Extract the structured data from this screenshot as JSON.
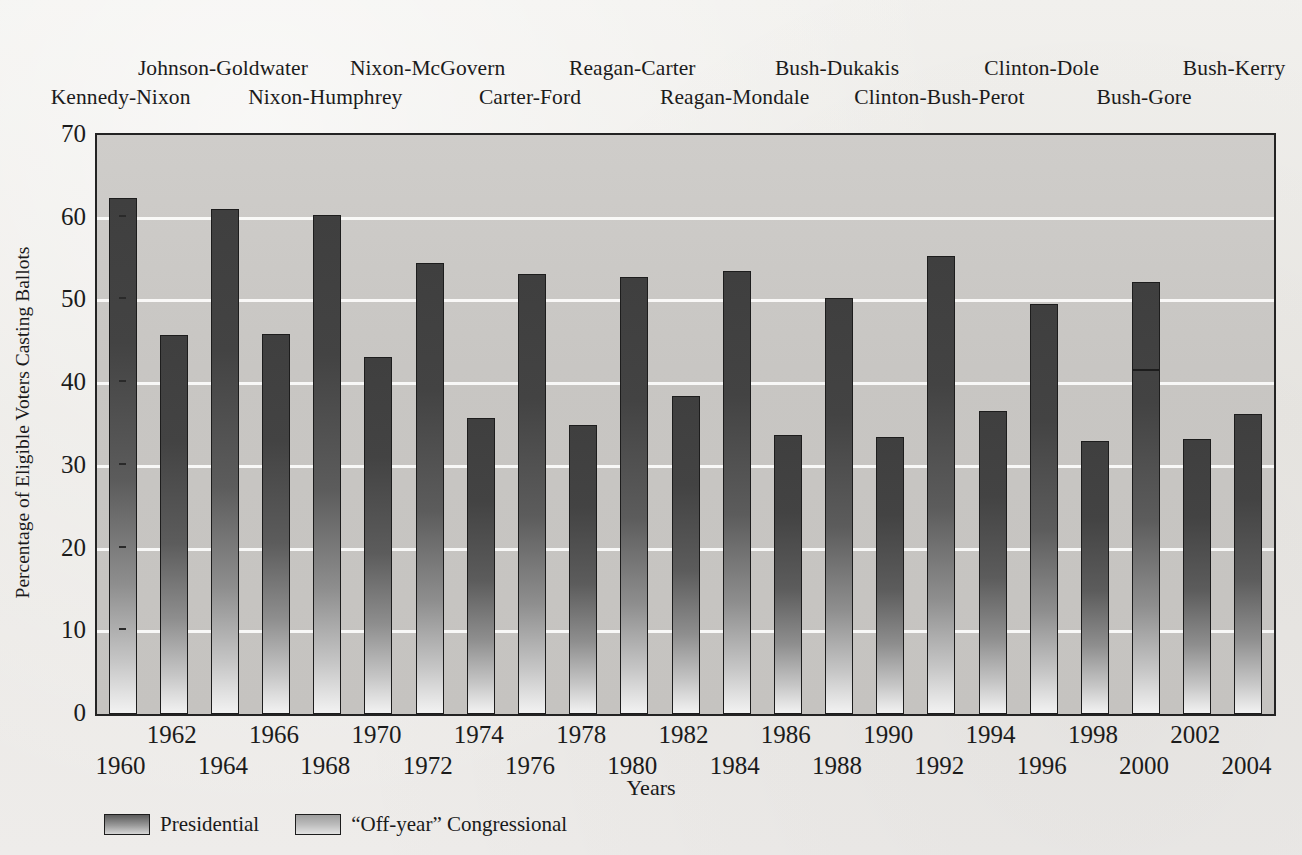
{
  "chart_data": {
    "type": "bar",
    "title": "",
    "xlabel": "Years",
    "ylabel": "Percentage of Eligible Voters Casting Ballots",
    "ylim": [
      0,
      70
    ],
    "ytick_values": [
      0,
      10,
      20,
      30,
      40,
      50,
      60,
      70
    ],
    "ytick_labels": [
      "0",
      "10",
      "20",
      "30",
      "40",
      "50",
      "60",
      "70"
    ],
    "grid": "horizontal-white-gridlines",
    "legend_position": "below-plot-left",
    "categories": [
      "1960",
      "1962",
      "1964",
      "1966",
      "1968",
      "1970",
      "1972",
      "1974",
      "1976",
      "1978",
      "1980",
      "1982",
      "1984",
      "1986",
      "1988",
      "1990",
      "1992",
      "1994",
      "1996",
      "1998",
      "2000",
      "2002",
      "2004"
    ],
    "values": [
      62.4,
      45.8,
      61.0,
      46.0,
      60.3,
      43.2,
      54.5,
      35.8,
      53.2,
      35.0,
      52.8,
      38.4,
      53.5,
      33.7,
      50.3,
      33.5,
      55.4,
      36.6,
      49.6,
      33.0,
      52.2,
      33.2,
      36.3
    ],
    "series_assignment": [
      "Presidential",
      "Off-year Congressional",
      "Presidential",
      "Off-year Congressional",
      "Presidential",
      "Off-year Congressional",
      "Presidential",
      "Off-year Congressional",
      "Presidential",
      "Off-year Congressional",
      "Presidential",
      "Off-year Congressional",
      "Presidential",
      "Off-year Congressional",
      "Presidential",
      "Off-year Congressional",
      "Presidential",
      "Off-year Congressional",
      "Presidential",
      "Off-year Congressional",
      "Presidential",
      "Off-year Congressional",
      "Presidential"
    ],
    "annotations": [
      {
        "category": "2000",
        "type": "internal-divider-line",
        "value": 41.5
      }
    ],
    "legend": [
      {
        "key": "presidential",
        "label": "Presidential"
      },
      {
        "key": "offyear",
        "label": "“Off-year” Congressional"
      }
    ],
    "election_labels": [
      {
        "text": "Kennedy-Nixon",
        "year": 1960,
        "row": 1
      },
      {
        "text": "Johnson-Goldwater",
        "year": 1964,
        "row": 0
      },
      {
        "text": "Nixon-Humphrey",
        "year": 1968,
        "row": 1
      },
      {
        "text": "Nixon-McGovern",
        "year": 1972,
        "row": 0
      },
      {
        "text": "Carter-Ford",
        "year": 1976,
        "row": 1
      },
      {
        "text": "Reagan-Carter",
        "year": 1980,
        "row": 0
      },
      {
        "text": "Reagan-Mondale",
        "year": 1984,
        "row": 1
      },
      {
        "text": "Bush-Dukakis",
        "year": 1988,
        "row": 0
      },
      {
        "text": "Clinton-Bush-Perot",
        "year": 1992,
        "row": 1
      },
      {
        "text": "Clinton-Dole",
        "year": 1996,
        "row": 0
      },
      {
        "text": "Bush-Gore",
        "year": 2000,
        "row": 1
      },
      {
        "text": "Bush-Kerry",
        "year": 2004,
        "row": 0
      }
    ],
    "xtick_rows": [
      {
        "label": "1960",
        "row": 1
      },
      {
        "label": "1962",
        "row": 0
      },
      {
        "label": "1964",
        "row": 1
      },
      {
        "label": "1966",
        "row": 0
      },
      {
        "label": "1968",
        "row": 1
      },
      {
        "label": "1970",
        "row": 0
      },
      {
        "label": "1972",
        "row": 1
      },
      {
        "label": "1974",
        "row": 0
      },
      {
        "label": "1976",
        "row": 1
      },
      {
        "label": "1978",
        "row": 0
      },
      {
        "label": "1980",
        "row": 1
      },
      {
        "label": "1982",
        "row": 0
      },
      {
        "label": "1984",
        "row": 1
      },
      {
        "label": "1986",
        "row": 0
      },
      {
        "label": "1988",
        "row": 1
      },
      {
        "label": "1990",
        "row": 0
      },
      {
        "label": "1992",
        "row": 1
      },
      {
        "label": "1994",
        "row": 0
      },
      {
        "label": "1996",
        "row": 1
      },
      {
        "label": "1998",
        "row": 0
      },
      {
        "label": "2000",
        "row": 1
      },
      {
        "label": "2002",
        "row": 0
      },
      {
        "label": "2004",
        "row": 1
      }
    ]
  },
  "colors": {
    "page_background": "#eceae6",
    "plot_background": "#c8c6c3",
    "gridline": "#fbfbfa",
    "bar_top": "#3f3f3f",
    "bar_bottom": "#f2f2f2",
    "axis_border": "#232323",
    "text": "#1b1b1b"
  }
}
